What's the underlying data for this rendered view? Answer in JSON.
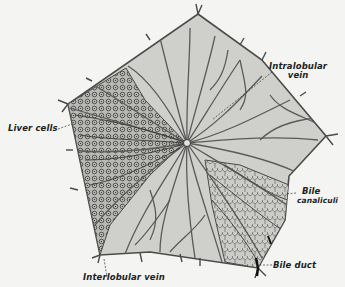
{
  "figure": {
    "background_color": "#f4f4f2",
    "lobule_fill": "#cfcfcb",
    "line_color": "#4a4a4a",
    "cell_region_fill": "#bdbdb9"
  },
  "labels": {
    "intralobular_vein": {
      "line1": "Intralobular",
      "line2": "vein"
    },
    "liver_cells": {
      "text": "Liver cells"
    },
    "bile_canaliculi": {
      "line1": "Bile",
      "line2": "canaliculi"
    },
    "bile_duct": {
      "text": "Bile duct"
    },
    "interlobular_vein": {
      "text": "Interlobular vein"
    }
  }
}
